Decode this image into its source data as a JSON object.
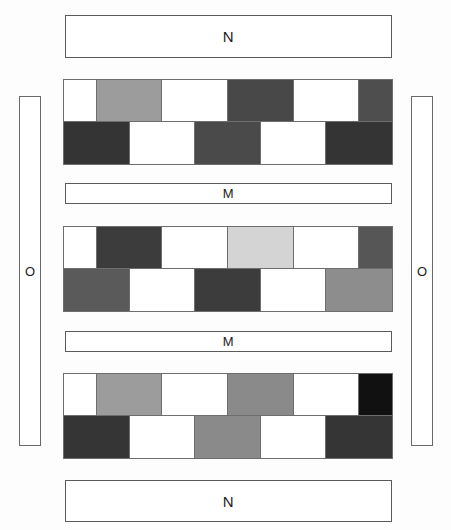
{
  "figure": {
    "title_top": "N",
    "title_bottom": "N",
    "mid_label_1": "M",
    "mid_label_2": "M",
    "left_label": "O",
    "right_label": "O",
    "palette": {
      "white": "#ffffff",
      "light_gray": "#d4d4d4",
      "medium_light_gray": "#9c9c9c",
      "medium_gray": "#8d8d8d",
      "dark_gray": "#5e5e5e",
      "darker_gray": "#484848",
      "very_dark_gray": "#3a3a3a",
      "near_black": "#111111",
      "outline": "#6e6e6e"
    },
    "bars": [
      {
        "name": "top-n-bar",
        "label": "N",
        "x": 65,
        "y": 15,
        "w": 327,
        "h": 43,
        "size": "tall"
      },
      {
        "name": "mid-m-bar-1",
        "label": "M",
        "x": 65,
        "y": 183,
        "w": 327,
        "h": 21,
        "size": "thin"
      },
      {
        "name": "mid-m-bar-2",
        "label": "M",
        "x": 65,
        "y": 331,
        "w": 327,
        "h": 21,
        "size": "thin"
      },
      {
        "name": "bottom-n-bar",
        "label": "N",
        "x": 65,
        "y": 480,
        "w": 327,
        "h": 42,
        "size": "tall"
      }
    ],
    "side_bars": [
      {
        "name": "left-o-bar",
        "label": "O",
        "x": 19,
        "y": 96,
        "w": 22,
        "h": 350
      },
      {
        "name": "right-o-bar",
        "label": "O",
        "x": 411,
        "y": 96,
        "w": 22,
        "h": 350
      }
    ],
    "blocks": [
      {
        "name": "checkered-block-1",
        "x": 63,
        "y": 79,
        "w": 330,
        "h": 86,
        "top_row": [
          {
            "span": 1,
            "color": "#ffffff"
          },
          {
            "span": 2,
            "color": "#9c9c9c"
          },
          {
            "span": 2,
            "color": "#ffffff"
          },
          {
            "span": 2,
            "color": "#484848"
          },
          {
            "span": 2,
            "color": "#ffffff"
          },
          {
            "span": 2,
            "color": "#4e4e4e"
          },
          {
            "span": 1,
            "color": "#ffffff"
          }
        ],
        "bottom_row": [
          {
            "span": 2,
            "color": "#343434"
          },
          {
            "span": 2,
            "color": "#ffffff"
          },
          {
            "span": 2,
            "color": "#4a4a4a"
          },
          {
            "span": 2,
            "color": "#ffffff"
          },
          {
            "span": 2,
            "color": "#343434"
          }
        ]
      },
      {
        "name": "checkered-block-2",
        "x": 63,
        "y": 226,
        "w": 330,
        "h": 86,
        "top_row": [
          {
            "span": 1,
            "color": "#ffffff"
          },
          {
            "span": 2,
            "color": "#3c3c3c"
          },
          {
            "span": 2,
            "color": "#ffffff"
          },
          {
            "span": 2,
            "color": "#d4d4d4"
          },
          {
            "span": 2,
            "color": "#ffffff"
          },
          {
            "span": 2,
            "color": "#565656"
          },
          {
            "span": 1,
            "color": "#ffffff"
          }
        ],
        "bottom_row": [
          {
            "span": 2,
            "color": "#5a5a5a"
          },
          {
            "span": 2,
            "color": "#ffffff"
          },
          {
            "span": 2,
            "color": "#3c3c3c"
          },
          {
            "span": 2,
            "color": "#ffffff"
          },
          {
            "span": 2,
            "color": "#8d8d8d"
          }
        ]
      },
      {
        "name": "checkered-block-3",
        "x": 63,
        "y": 373,
        "w": 330,
        "h": 86,
        "top_row": [
          {
            "span": 1,
            "color": "#ffffff"
          },
          {
            "span": 2,
            "color": "#9c9c9c"
          },
          {
            "span": 2,
            "color": "#ffffff"
          },
          {
            "span": 2,
            "color": "#8a8a8a"
          },
          {
            "span": 2,
            "color": "#ffffff"
          },
          {
            "span": 2,
            "color": "#111111"
          },
          {
            "span": 1,
            "color": "#ffffff"
          }
        ],
        "bottom_row": [
          {
            "span": 2,
            "color": "#353535"
          },
          {
            "span": 2,
            "color": "#ffffff"
          },
          {
            "span": 2,
            "color": "#8a8a8a"
          },
          {
            "span": 2,
            "color": "#ffffff"
          },
          {
            "span": 2,
            "color": "#353535"
          }
        ]
      }
    ]
  }
}
